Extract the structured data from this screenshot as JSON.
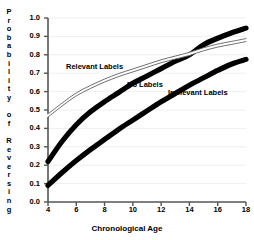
{
  "chart_data": {
    "type": "line",
    "title": "",
    "xlabel": "Chronological Age",
    "ylabel": "Probability of Reversing",
    "xlim": [
      4,
      18
    ],
    "ylim": [
      0.0,
      1.0
    ],
    "grid": true,
    "legend_position": "inline-annotations",
    "xticks": [
      "4",
      "6",
      "8",
      "10",
      "12",
      "14",
      "16",
      "18"
    ],
    "xtick_values": [
      4,
      6,
      8,
      10,
      12,
      14,
      16,
      18
    ],
    "yticks": [
      "0.0",
      "0.1",
      "0.2",
      "0.3",
      "0.4",
      "0.5",
      "0.6",
      "0.7",
      "0.8",
      "0.9",
      "1.0"
    ],
    "ytick_values": [
      0.0,
      0.1,
      0.2,
      0.3,
      0.4,
      0.5,
      0.6,
      0.7,
      0.8,
      0.9,
      1.0
    ],
    "x": [
      4,
      5,
      6,
      7,
      8,
      9,
      10,
      11,
      12,
      13,
      14,
      15,
      16,
      17,
      18
    ],
    "series": [
      {
        "name": "Relevant Labels",
        "style": "thin-outline",
        "values": [
          0.47,
          0.53,
          0.585,
          0.625,
          0.66,
          0.69,
          0.715,
          0.74,
          0.765,
          0.785,
          0.805,
          0.83,
          0.85,
          0.865,
          0.88
        ]
      },
      {
        "name": "No Labels",
        "style": "thick-black",
        "values": [
          0.22,
          0.33,
          0.42,
          0.49,
          0.545,
          0.595,
          0.645,
          0.685,
          0.725,
          0.765,
          0.8,
          0.855,
          0.89,
          0.92,
          0.945
        ]
      },
      {
        "name": "Irrelevant Labels",
        "style": "thick-black",
        "values": [
          0.09,
          0.16,
          0.225,
          0.285,
          0.34,
          0.395,
          0.445,
          0.495,
          0.545,
          0.59,
          0.635,
          0.675,
          0.715,
          0.75,
          0.775
        ]
      }
    ]
  },
  "axes": {
    "ylabel_letters": [
      "P",
      "r",
      "o",
      "b",
      "a",
      "b",
      "i",
      "l",
      "i",
      "t",
      "y",
      "",
      "o",
      "f",
      "",
      "R",
      "e",
      "v",
      "e",
      "r",
      "s",
      "i",
      "n",
      "g"
    ]
  }
}
